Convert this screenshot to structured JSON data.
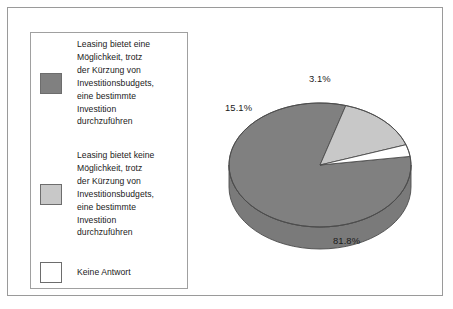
{
  "figure": {
    "background_color": "#ffffff",
    "frame_color": "#9a9a9a"
  },
  "legend": {
    "border_color": "#a0a0a0",
    "items": [
      {
        "label": "Leasing bietet eine\nMöglichkeit, trotz\nder Kürzung von\nInvestitionsbudgets,\neine bestimmte\nInvestition\ndurchzuführen",
        "color": "#808080",
        "swatch_name": "legend-swatch-dark-gray"
      },
      {
        "label": "Leasing bietet keine\nMöglichkeit, trotz\nder Kürzung von\nInvestitionsbudgets,\neine bestimmte\nInvestition\ndurchzuführen",
        "color": "#c8c8c8",
        "swatch_name": "legend-swatch-light-gray"
      },
      {
        "label": "Keine Antwort",
        "color": "#ffffff",
        "swatch_name": "legend-swatch-white"
      }
    ]
  },
  "chart_data": {
    "type": "pie",
    "title": "",
    "subtitle": "",
    "xlabel": "",
    "ylabel": "",
    "grid": false,
    "legend_position": "left",
    "three_d": true,
    "categories": [
      "Leasing bietet eine Möglichkeit, trotz der Kürzung von Investitionsbudgets, eine bestimmte Investition durchzuführen",
      "Leasing bietet keine Möglichkeit, trotz der Kürzung von Investitionsbudgets, eine bestimmte Investition durchzuführen",
      "Keine Antwort"
    ],
    "values": [
      81.8,
      15.1,
      3.1
    ],
    "value_unit": "%",
    "data_labels": [
      "81.8%",
      "15.1%",
      "3.1%"
    ],
    "colors": [
      "#808080",
      "#c8c8c8",
      "#ffffff"
    ],
    "slice_edge_color": "#4c4c4c",
    "start_angle_deg": 352,
    "direction": "clockwise"
  },
  "pie_labels": {
    "dark": "81.8%",
    "light": "15.1%",
    "white": "3.1%"
  }
}
